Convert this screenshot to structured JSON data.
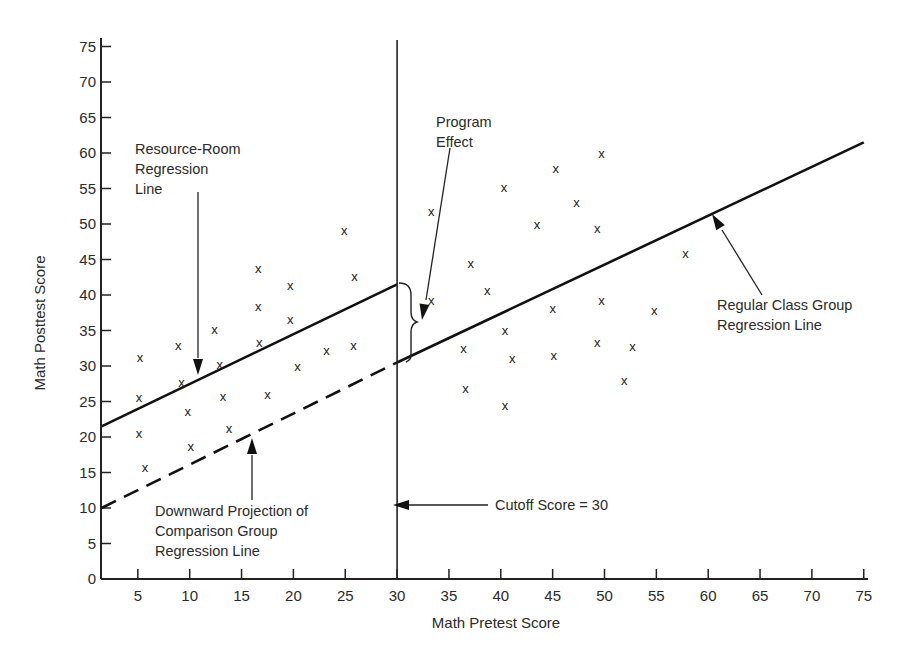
{
  "chart_data": {
    "type": "scatter",
    "title": "",
    "xlabel": "Math Pretest Score",
    "ylabel": "Math Posttest Score",
    "xlim": [
      0,
      75
    ],
    "ylim": [
      0,
      75
    ],
    "x_ticks": [
      5,
      10,
      15,
      20,
      25,
      30,
      35,
      40,
      45,
      50,
      55,
      60,
      65,
      70,
      75
    ],
    "y_ticks": [
      0,
      5,
      10,
      15,
      20,
      25,
      30,
      35,
      40,
      45,
      50,
      55,
      60,
      65,
      70,
      75
    ],
    "grid": false,
    "legend": null,
    "marker": "x",
    "series": [
      {
        "name": "Resource-Room Group",
        "points": [
          [
            5.2,
            31.2
          ],
          [
            5.1,
            25.6
          ],
          [
            5.1,
            20.6
          ],
          [
            5.7,
            15.8
          ],
          [
            8.9,
            32.9
          ],
          [
            9.2,
            27.8
          ],
          [
            9.8,
            23.6
          ],
          [
            10.1,
            18.7
          ],
          [
            12.4,
            35.2
          ],
          [
            12.9,
            30.3
          ],
          [
            13.2,
            25.8
          ],
          [
            13.8,
            21.3
          ],
          [
            16.6,
            43.8
          ],
          [
            16.6,
            38.5
          ],
          [
            16.7,
            33.4
          ],
          [
            17.5,
            26.0
          ],
          [
            19.7,
            41.4
          ],
          [
            19.7,
            36.6
          ],
          [
            20.4,
            30.0
          ],
          [
            23.2,
            32.3
          ],
          [
            24.9,
            49.2
          ],
          [
            25.9,
            42.7
          ],
          [
            25.8,
            33.0
          ]
        ]
      },
      {
        "name": "Regular Class Group",
        "points": [
          [
            33.3,
            51.8
          ],
          [
            33.3,
            39.3
          ],
          [
            37.1,
            44.5
          ],
          [
            36.4,
            32.5
          ],
          [
            36.6,
            26.9
          ],
          [
            38.7,
            40.7
          ],
          [
            40.3,
            55.2
          ],
          [
            40.4,
            35.1
          ],
          [
            40.4,
            24.5
          ],
          [
            41.1,
            31.1
          ],
          [
            43.5,
            49.99
          ],
          [
            45.0,
            38.1
          ],
          [
            45.1,
            31.5
          ],
          [
            45.3,
            57.9
          ],
          [
            47.3,
            53.1
          ],
          [
            49.3,
            49.4
          ],
          [
            49.3,
            33.4
          ],
          [
            49.7,
            39.3
          ],
          [
            49.7,
            60.0
          ],
          [
            51.9,
            28.0
          ],
          [
            52.7,
            32.8
          ],
          [
            54.8,
            37.9
          ],
          [
            57.8,
            45.9
          ]
        ]
      }
    ],
    "lines": [
      {
        "name": "Resource-Room Regression Line",
        "style": "solid",
        "from": [
          1.5,
          21.5
        ],
        "to": [
          30,
          41.5
        ]
      },
      {
        "name": "Downward Projection of Comparison Group Regression Line",
        "style": "dashed",
        "from": [
          1.5,
          10
        ],
        "to": [
          30,
          30.5
        ]
      },
      {
        "name": "Regular Class Group Regression Line",
        "style": "solid",
        "from": [
          30,
          30.5
        ],
        "to": [
          75,
          61.5
        ]
      },
      {
        "name": "Cutoff Score",
        "style": "solid-vertical",
        "x": 30,
        "y_range": [
          0,
          76
        ]
      }
    ],
    "annotations": [
      {
        "text": "Resource-Room Regression Line",
        "lines": [
          "Resource-Room",
          "Regression",
          "Line"
        ],
        "points_to": [
          11,
          28.5
        ]
      },
      {
        "text": "Program Effect",
        "lines": [
          "Program",
          "Effect"
        ],
        "points_to": [
          31.5,
          38
        ],
        "brace": [
          [
            31.5,
            30.8
          ],
          [
            31.5,
            41.5
          ]
        ]
      },
      {
        "text": "Regular Class Group Regression Line",
        "lines": [
          "Regular Class Group",
          "Regression Line"
        ],
        "points_to": [
          60.5,
          51.5
        ]
      },
      {
        "text": "Downward Projection of Comparison Group Regression Line",
        "lines": [
          "Downward Projection of",
          "Comparison Group",
          "Regression Line"
        ],
        "points_to": [
          16.5,
          20.5
        ]
      },
      {
        "text": "Cutoff Score = 30",
        "lines": [
          "Cutoff Score  =  30"
        ],
        "points_to": [
          30,
          10.5
        ]
      }
    ]
  }
}
